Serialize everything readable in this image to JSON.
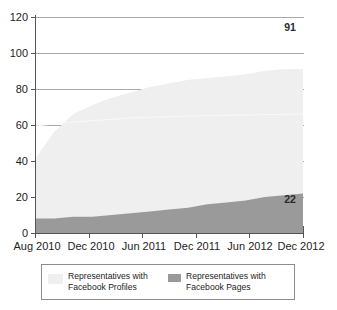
{
  "chart_data": {
    "type": "area",
    "stacked": true,
    "title": "",
    "xlabel": "",
    "ylabel": "",
    "ylim": [
      0,
      120
    ],
    "yticks": [
      0,
      20,
      40,
      60,
      80,
      100,
      120
    ],
    "grid": true,
    "grid_axis": "y",
    "legend_position": "bottom",
    "x": [
      "Aug 2010",
      "Oct 2010",
      "Dec 2010",
      "Feb 2011",
      "Apr 2011",
      "Jun 2011",
      "Aug 2011",
      "Oct 2011",
      "Dec 2011",
      "Feb 2012",
      "Apr 2012",
      "Jun 2012",
      "Aug 2012",
      "Oct 2012",
      "Dec 2012"
    ],
    "xticks": [
      "Aug 2010",
      "Dec 2010",
      "Jun 2011",
      "Dec 2011",
      "Jun 2012",
      "Dec 2012"
    ],
    "series": [
      {
        "name": "Representatives with Facebook Pages",
        "color": "#9a9a9a",
        "values": [
          8,
          8,
          9,
          9,
          10,
          11,
          12,
          13,
          14,
          16,
          17,
          18,
          20,
          21,
          22
        ],
        "end_label": "22"
      },
      {
        "name": "Representatives with Facebook Profiles",
        "color": "#eeeeee",
        "values": [
          33,
          48,
          57,
          62,
          65,
          67,
          69,
          70,
          71,
          70,
          70,
          70,
          70,
          70,
          69
        ],
        "end_label": "91"
      }
    ],
    "totals": [
      41,
      56,
      66,
      71,
      75,
      78,
      81,
      83,
      85,
      86,
      87,
      88,
      90,
      91,
      91
    ],
    "annotations": [
      {
        "text": "91",
        "series": "Representatives with Facebook Profiles",
        "at": "Dec 2012",
        "value": 91
      },
      {
        "text": "22",
        "series": "Representatives with Facebook Pages",
        "at": "Dec 2012",
        "value": 22
      }
    ]
  },
  "legend": {
    "entries": [
      {
        "swatch_color": "#efefef",
        "line1": "Representatives with",
        "line2": "Facebook Profiles"
      },
      {
        "swatch_color": "#9a9a9a",
        "line1": "Representatives with",
        "line2": "Facebook Pages"
      }
    ]
  },
  "axes": {
    "y_tick_labels": [
      "120",
      "100",
      "80",
      "60",
      "40",
      "20",
      "0"
    ],
    "x_tick_labels": [
      "Aug 2010",
      "Dec 2010",
      "Jun 2011",
      "Dec 2011",
      "Jun 2012",
      "Dec 2012"
    ]
  }
}
